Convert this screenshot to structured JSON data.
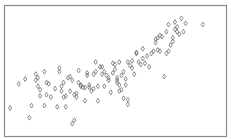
{
  "chart_data": {
    "type": "scatter",
    "title": "",
    "xlabel": "",
    "ylabel": "",
    "xlim": [
      0,
      100
    ],
    "ylim": [
      0,
      100
    ],
    "grid": false,
    "legend": null,
    "marker": "diamond-open",
    "marker_color": "#6e6e6e",
    "frame_color": "#8a8a8a",
    "series": [
      {
        "name": "points",
        "points": [
          [
            1,
            19
          ],
          [
            5,
            39
          ],
          [
            8,
            43
          ],
          [
            10,
            11
          ],
          [
            11,
            21
          ],
          [
            13,
            42
          ],
          [
            13,
            47
          ],
          [
            14,
            37
          ],
          [
            14,
            44
          ],
          [
            15,
            34
          ],
          [
            15,
            29
          ],
          [
            17,
            49
          ],
          [
            17,
            21
          ],
          [
            18,
            40
          ],
          [
            18,
            30
          ],
          [
            19,
            39
          ],
          [
            20,
            28
          ],
          [
            22,
            35
          ],
          [
            23,
            20
          ],
          [
            24,
            52
          ],
          [
            24,
            49
          ],
          [
            25,
            37
          ],
          [
            25,
            33
          ],
          [
            26,
            28
          ],
          [
            26,
            40
          ],
          [
            27,
            29
          ],
          [
            27,
            20
          ],
          [
            28,
            44
          ],
          [
            29,
            45
          ],
          [
            29,
            33
          ],
          [
            30,
            42
          ],
          [
            30,
            6
          ],
          [
            31,
            9
          ],
          [
            31,
            30
          ],
          [
            32,
            31
          ],
          [
            32,
            28
          ],
          [
            33,
            40
          ],
          [
            33,
            50
          ],
          [
            34,
            37
          ],
          [
            34,
            38
          ],
          [
            35,
            36
          ],
          [
            36,
            25
          ],
          [
            36,
            36
          ],
          [
            37,
            48
          ],
          [
            37,
            46
          ],
          [
            38,
            38
          ],
          [
            38,
            36
          ],
          [
            39,
            33
          ],
          [
            40,
            35
          ],
          [
            40,
            47
          ],
          [
            41,
            57
          ],
          [
            41,
            49
          ],
          [
            42,
            37
          ],
          [
            42,
            25
          ],
          [
            43,
            53
          ],
          [
            44,
            53
          ],
          [
            44,
            47
          ],
          [
            45,
            37
          ],
          [
            45,
            49
          ],
          [
            46,
            46
          ],
          [
            47,
            44
          ],
          [
            47,
            42
          ],
          [
            48,
            32
          ],
          [
            49,
            48
          ],
          [
            49,
            56
          ],
          [
            50,
            55
          ],
          [
            50,
            51
          ],
          [
            51,
            44
          ],
          [
            51,
            40
          ],
          [
            51,
            42
          ],
          [
            52,
            38
          ],
          [
            52,
            33
          ],
          [
            52,
            57
          ],
          [
            53,
            34
          ],
          [
            53,
            46
          ],
          [
            54,
            49
          ],
          [
            54,
            27
          ],
          [
            55,
            38
          ],
          [
            55,
            43
          ],
          [
            56,
            22
          ],
          [
            56,
            26
          ],
          [
            56,
            57
          ],
          [
            57,
            54
          ],
          [
            58,
            58
          ],
          [
            58,
            52
          ],
          [
            59,
            47
          ],
          [
            60,
            65
          ],
          [
            60,
            64
          ],
          [
            61,
            57
          ],
          [
            62,
            55
          ],
          [
            63,
            68
          ],
          [
            63,
            60
          ],
          [
            64,
            56
          ],
          [
            65,
            62
          ],
          [
            66,
            53
          ],
          [
            67,
            64
          ],
          [
            68,
            66
          ],
          [
            69,
            76
          ],
          [
            69,
            73
          ],
          [
            70,
            67
          ],
          [
            70,
            77
          ],
          [
            71,
            66
          ],
          [
            71,
            79
          ],
          [
            72,
            78
          ],
          [
            73,
            45
          ],
          [
            74,
            64
          ],
          [
            74,
            82
          ],
          [
            75,
            88
          ],
          [
            75,
            66
          ],
          [
            76,
            71
          ],
          [
            77,
            74
          ],
          [
            77,
            77
          ],
          [
            78,
            90
          ],
          [
            78,
            84
          ],
          [
            79,
            82
          ],
          [
            79,
            86
          ],
          [
            80,
            80
          ],
          [
            81,
            93
          ],
          [
            82,
            82
          ],
          [
            83,
            89
          ],
          [
            91,
            88
          ]
        ]
      }
    ]
  }
}
